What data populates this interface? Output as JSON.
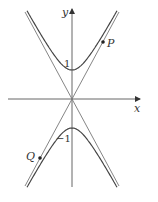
{
  "figure": {
    "type": "hyperbola-with-asymptotes",
    "axes": {
      "x_label": "x",
      "y_label": "y"
    },
    "tick_labels": {
      "upper_vertex": "1",
      "lower_vertex": "−1"
    },
    "points": {
      "P": "P",
      "Q": "Q"
    },
    "colors": {
      "curve": "#444444",
      "axis": "#555555",
      "asymptote": "#666666",
      "point": "#222222"
    }
  }
}
